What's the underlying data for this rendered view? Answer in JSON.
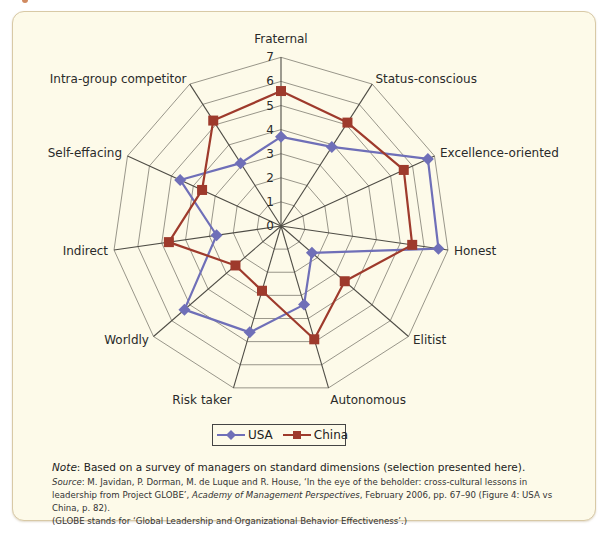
{
  "chart_data": {
    "type": "radar",
    "title": "",
    "categories": [
      "Fraternal",
      "Status-conscious",
      "Excellence-oriented",
      "Honest",
      "Elitist",
      "Autonomous",
      "Risk taker",
      "Worldly",
      "Indirect",
      "Self-effacing",
      "Intra-group competitor"
    ],
    "series": [
      {
        "name": "USA",
        "color": "#6f6fb8",
        "marker": "diamond",
        "values": [
          3.7,
          3.9,
          6.7,
          6.6,
          1.7,
          3.4,
          4.6,
          5.3,
          2.7,
          4.6,
          3.1
        ]
      },
      {
        "name": "China",
        "color": "#9e3a2c",
        "marker": "square",
        "values": [
          5.6,
          5.1,
          5.6,
          5.5,
          3.5,
          4.9,
          2.8,
          2.5,
          4.7,
          3.6,
          5.2
        ]
      }
    ],
    "rlim": [
      0,
      7
    ],
    "ticks": [
      "0",
      "1",
      "2",
      "3",
      "4",
      "5",
      "6",
      "7"
    ],
    "grid": true,
    "legend_position": "bottom"
  },
  "legend": {
    "usa": "USA",
    "china": "China"
  },
  "notes": {
    "note_label": "Note",
    "note_text": ": Based on a survey of managers on standard dimensions (selection presented here).",
    "source_label": "Source",
    "source_text_1": ": M. Javidan, P. Dorman, M. de Luque and R. House, ‘In the eye of the beholder: cross-cultural lessons in leadership from Project GLOBE’, ",
    "source_journal": "Academy of Management Perspectives",
    "source_text_2": ", February 2006, pp. 67–90 (Figure 4: USA vs China, p. 82).",
    "source_text_3": "(GLOBE stands for ‘Global Leadership and Organizational Behavior Effectiveness’.)"
  }
}
